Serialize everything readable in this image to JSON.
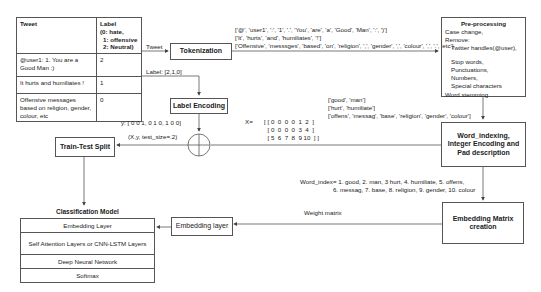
{
  "table": {
    "headers": [
      "Tweet",
      "Label\n(0: hate,\n 1: offensive\n 2: Neutral)"
    ],
    "header_tweet": "Tweet",
    "header_label_l1": "Label",
    "header_label_l2": "(0: hate,",
    "header_label_l3": "1: offensive",
    "header_label_l4": "2: Neutral)",
    "rows": [
      {
        "tweet": "@user1: 1. You are a Good Man :)",
        "label": "2"
      },
      {
        "tweet": "It hurts and humiliates !",
        "label": "1"
      },
      {
        "tweet": "Offensive messages based on religion, gender, colour, etc",
        "label": "0"
      }
    ]
  },
  "edges": {
    "tweet": "Tweet",
    "label": "Label: [2,1,0]",
    "y": "y: [ 0 0 1,  0 1 0, 1 0 0]",
    "xy_split": "(X,y, test_size=.2)",
    "x_eq": "X=",
    "weight_matrix": "Weight matrix"
  },
  "tokens": {
    "line1": "['@', 'user1', ':', '1', '.', 'You', 'are', 'a', 'Good', 'Man', ':', ')']",
    "line2": "['It', 'hurts', 'and', 'humiliates', '!']",
    "line3": "['Offensive', 'messsges', 'based', 'on', 'religion', ',', 'gender', ',', 'colour', ',', '.', 'etc']"
  },
  "stemmed": {
    "line1": "['good', 'man']",
    "line2": "['hurt', 'humiliate']",
    "line3": "['offens', 'messag', 'base', 'religion',  'gender',  'colour']"
  },
  "matrix_x": {
    "row1": "[ [ 0  0  0  0  1  2  ]",
    "row2": "  [ 0  0  0  0  3  4  ]",
    "row3": "  [ 5  6  7  8  9 10  ] ]"
  },
  "word_index": {
    "line1": "Word_index= 1. good, 2. man, 3 hurt, 4. humiliate, 5. offens,",
    "line2": "6. messag, 7. base, 8. religion, 9. gender, 10. colour"
  },
  "nodes": {
    "tokenization": "Tokenization",
    "label_encoding": "Label Encoding",
    "train_test_split": "Train-Test Split",
    "word_indexing_l1": "Word_indexing,",
    "word_indexing_l2": "Integer Encoding and",
    "word_indexing_l3": "Pad description",
    "embedding_matrix_l1": "Embedding Matrix",
    "embedding_matrix_l2": "creation",
    "embedding_layer": "Embedding layer"
  },
  "preprocessing": {
    "title": "Pre-processing",
    "l1": "Case change,",
    "l2": "Remove:",
    "l3": "Twitter handles(@user),",
    "l4": "Stop words,",
    "l5": "Punctuations,",
    "l6": "Numbers,",
    "l7": "Special characters",
    "l8": "Word stemming"
  },
  "model": {
    "title": "Classification Model",
    "layers": [
      "Embedding Layer",
      "Self Attention Layers or CNN-LSTM Layers",
      "Deep Neural Network",
      "Softmax"
    ]
  },
  "colors": {
    "line": "#555555",
    "text": "#222222",
    "background": "#ffffff"
  }
}
